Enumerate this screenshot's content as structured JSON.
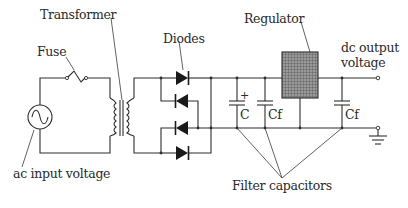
{
  "diagram": {
    "labels": {
      "transformer": "Transformer",
      "fuse": "Fuse",
      "diodes": "Diodes",
      "regulator": "Regulator",
      "dc_output_line1": "dc output",
      "dc_output_line2": "voltage",
      "ac_input": "ac input voltage",
      "filter_capacitors": "Filter capacitors",
      "cap_c": "C",
      "cap_cf1": "Cf",
      "cap_cf2": "Cf",
      "polarity_plus": "+"
    },
    "components": [
      "ac source",
      "fuse",
      "transformer",
      "bridge rectifier (4 diodes)",
      "electrolytic capacitor C",
      "filter capacitor Cf",
      "regulator",
      "filter capacitor Cf",
      "ground"
    ],
    "colors": {
      "line": "#2e2e2e",
      "regulator_fill": "#8c8c8c",
      "background": "#ffffff"
    }
  }
}
